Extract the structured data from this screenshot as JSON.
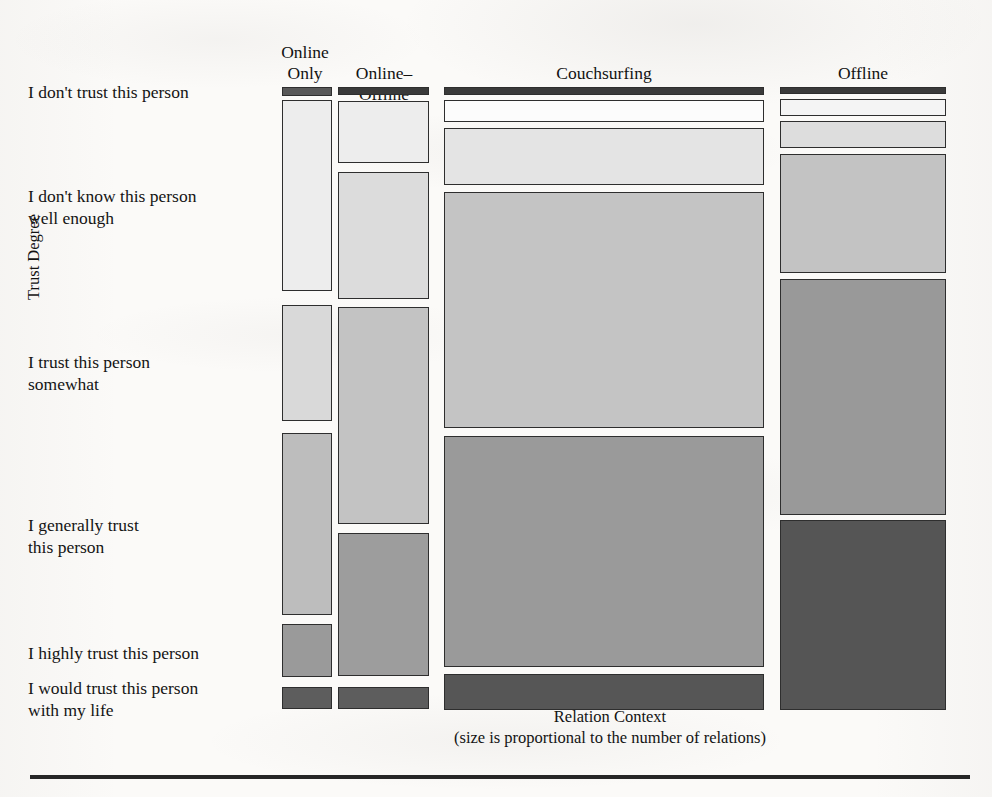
{
  "figure": {
    "y_axis_title": "Trust Degree",
    "x_axis_title": "Relation Context",
    "x_axis_subtitle": "(size is proportional to the number of relations)"
  },
  "columns": [
    {
      "label_line1": "Online",
      "label_line2": "Only"
    },
    {
      "label_line1": "",
      "label_line2": "Online–Offline"
    },
    {
      "label_line1": "",
      "label_line2": "Couchsurfing"
    },
    {
      "label_line1": "",
      "label_line2": "Offline"
    }
  ],
  "rows": [
    {
      "label_line1": "I don't trust this person",
      "label_line2": ""
    },
    {
      "label_line1": "I don't know this person",
      "label_line2": "well enough"
    },
    {
      "label_line1": "I trust this person",
      "label_line2": "somewhat"
    },
    {
      "label_line1": "I generally trust",
      "label_line2": "this person"
    },
    {
      "label_line1": "I highly trust this person",
      "label_line2": ""
    },
    {
      "label_line1": "I would trust this person",
      "label_line2": "with my life"
    }
  ],
  "chart_data": {
    "type": "bar",
    "subtype": "mosaic",
    "title": "",
    "xlabel": "Relation Context",
    "ylabel": "Trust Degree",
    "legend": "none",
    "grid": false,
    "note": "Mosaic plot: column width is proportional to number of relations in each relation context; tile height within a column is proportional to the share of that trust degree inside that context.",
    "categories_x": [
      "Online Only",
      "Online-Offline",
      "Couchsurfing",
      "Offline"
    ],
    "categories_y": [
      "I don't trust this person",
      "I don't know this person well enough",
      "I trust this person somewhat",
      "I generally trust this person",
      "I highly trust this person",
      "I would trust this person with my life"
    ],
    "column_width_share": [
      0.065,
      0.122,
      0.435,
      0.226
    ],
    "series": [
      {
        "name": "Online Only",
        "values": [
          0.015,
          0.35,
          0.21,
          0.255,
          0.105,
          0.04
        ]
      },
      {
        "name": "Online-Offline",
        "values": [
          0.01,
          0.16,
          0.27,
          0.355,
          0.155,
          0.035
        ]
      },
      {
        "name": "Couchsurfing",
        "values": [
          0.01,
          0.035,
          0.075,
          0.36,
          0.38,
          0.065
        ]
      },
      {
        "name": "Offline",
        "values": [
          0.01,
          0.03,
          0.05,
          0.19,
          0.3,
          0.31
        ]
      }
    ],
    "tile_fills": [
      "#fdfdfd",
      "#ececec",
      "#d6d6d6",
      "#bdbdbd",
      "#9b9b9b",
      "#6a6a6a"
    ],
    "tile_border_color": "#2e2e2e",
    "background_color": "#fbfaf8"
  },
  "layout": {
    "columns_px": [
      {
        "x": 282,
        "w": 50
      },
      {
        "x": 338,
        "w": 91
      },
      {
        "x": 444,
        "w": 320
      },
      {
        "x": 780,
        "w": 166
      }
    ],
    "tiles": [
      {
        "col": 0,
        "row": 0,
        "y": 87,
        "h": 9,
        "fill": "#585858"
      },
      {
        "col": 0,
        "row": 1,
        "y": 100,
        "h": 191,
        "fill": "#ededed"
      },
      {
        "col": 0,
        "row": 2,
        "y": 305,
        "h": 116,
        "fill": "#d9d9d9"
      },
      {
        "col": 0,
        "row": 3,
        "y": 433,
        "h": 182,
        "fill": "#bdbdbd"
      },
      {
        "col": 0,
        "row": 4,
        "y": 624,
        "h": 53,
        "fill": "#9a9a9a"
      },
      {
        "col": 0,
        "row": 5,
        "y": 687,
        "h": 22,
        "fill": "#5d5d5d"
      },
      {
        "col": 1,
        "row": 0,
        "y": 87,
        "h": 8,
        "fill": "#3a3a3a"
      },
      {
        "col": 1,
        "row": 1,
        "y": 101,
        "h": 62,
        "fill": "#ededed"
      },
      {
        "col": 1,
        "row": 2,
        "y": 172,
        "h": 127,
        "fill": "#dcdcdc"
      },
      {
        "col": 1,
        "row": 3,
        "y": 307,
        "h": 217,
        "fill": "#c3c3c3"
      },
      {
        "col": 1,
        "row": 4,
        "y": 533,
        "h": 143,
        "fill": "#9d9d9d"
      },
      {
        "col": 1,
        "row": 5,
        "y": 687,
        "h": 22,
        "fill": "#5d5d5d"
      },
      {
        "col": 2,
        "row": 0,
        "y": 87,
        "h": 8,
        "fill": "#3a3a3a"
      },
      {
        "col": 2,
        "row": 1,
        "y": 100,
        "h": 22,
        "fill": "#fcfcfc"
      },
      {
        "col": 2,
        "row": 2,
        "y": 128,
        "h": 57,
        "fill": "#e4e4e4"
      },
      {
        "col": 2,
        "row": 3,
        "y": 192,
        "h": 236,
        "fill": "#c4c4c4"
      },
      {
        "col": 2,
        "row": 4,
        "y": 436,
        "h": 231,
        "fill": "#9a9a9a"
      },
      {
        "col": 2,
        "row": 5,
        "y": 674,
        "h": 36,
        "fill": "#565656"
      },
      {
        "col": 3,
        "row": 0,
        "y": 87,
        "h": 7,
        "fill": "#3a3a3a"
      },
      {
        "col": 3,
        "row": 1,
        "y": 99,
        "h": 17,
        "fill": "#f4f4f4"
      },
      {
        "col": 3,
        "row": 2,
        "y": 121,
        "h": 27,
        "fill": "#dddddd"
      },
      {
        "col": 3,
        "row": 3,
        "y": 154,
        "h": 119,
        "fill": "#c3c3c3"
      },
      {
        "col": 3,
        "row": 4,
        "y": 279,
        "h": 236,
        "fill": "#999999"
      },
      {
        "col": 3,
        "row": 5,
        "y": 520,
        "h": 190,
        "fill": "#555555"
      }
    ],
    "column_header_px": [
      {
        "x": 272,
        "y": 42,
        "w": 66
      },
      {
        "x": 334,
        "y": 63,
        "w": 100
      },
      {
        "x": 444,
        "y": 63,
        "w": 320
      },
      {
        "x": 780,
        "y": 63,
        "w": 166
      }
    ],
    "row_label_px": [
      {
        "y": 82
      },
      {
        "y": 186
      },
      {
        "y": 352
      },
      {
        "y": 515
      },
      {
        "y": 643
      },
      {
        "y": 678
      }
    ]
  }
}
